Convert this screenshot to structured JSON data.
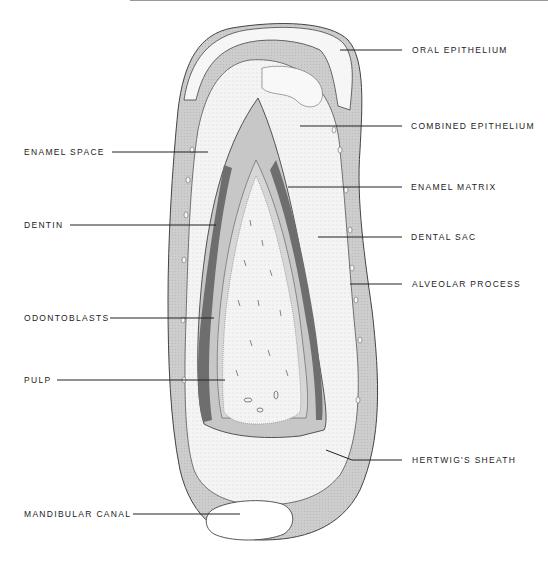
{
  "header": {
    "running_head": "Oral Histology"
  },
  "figure": {
    "colors": {
      "bone": "#cfcfcf",
      "enamel_space": "#c9c9c9",
      "enamel_matrix": "#6e6e6e",
      "dentin": "#d4d4d4",
      "pulp": "#f2f2f2",
      "outline": "#333333"
    }
  },
  "labels": {
    "left": [
      {
        "id": "enamel-space",
        "text": "ENAMEL SPACE"
      },
      {
        "id": "dentin",
        "text": "DENTIN"
      },
      {
        "id": "odontoblasts",
        "text": "ODONTOBLASTS"
      },
      {
        "id": "pulp",
        "text": "PULP"
      },
      {
        "id": "mandibular-canal",
        "text": "MANDIBULAR CANAL"
      }
    ],
    "right": [
      {
        "id": "oral-epithelium",
        "text": "ORAL EPITHELIUM"
      },
      {
        "id": "combined-epithelium",
        "text": "COMBINED EPITHELIUM"
      },
      {
        "id": "enamel-matrix",
        "text": "ENAMEL MATRIX"
      },
      {
        "id": "dental-sac",
        "text": "DENTAL SAC"
      },
      {
        "id": "alveolar-process",
        "text": "ALVEOLAR PROCESS"
      },
      {
        "id": "hertwigs-sheath",
        "text": "HERTWIG'S SHEATH"
      }
    ]
  }
}
